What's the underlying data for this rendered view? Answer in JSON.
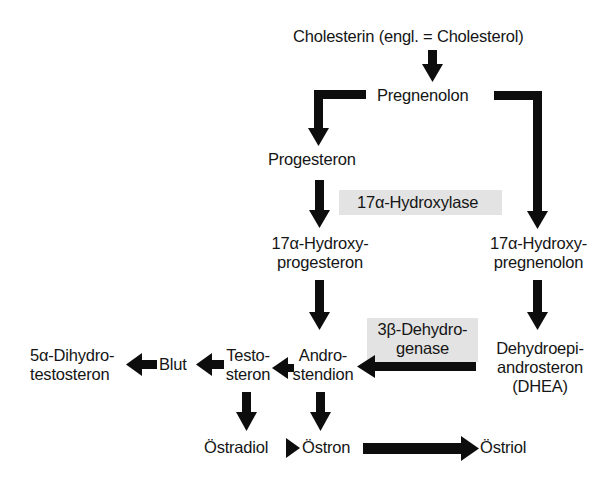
{
  "diagram": {
    "nodes": {
      "cholesterin": "Cholesterin (engl. = Cholesterol)",
      "pregnenolon": "Pregnenolon",
      "progesteron": "Progesteron",
      "hydroxyprogesteron_1": "17α-Hydroxy-",
      "hydroxyprogesteron_2": "progesteron",
      "hydroxypregnenolon_1": "17α-Hydroxy-",
      "hydroxypregnenolon_2": "pregnenolon",
      "dhea_1": "Dehydroepi-",
      "dhea_2": "androsteron",
      "dhea_3": "(DHEA)",
      "androstendion_1": "Andro-",
      "androstendion_2": "stendion",
      "testosteron_1": "Testo-",
      "testosteron_2": "steron",
      "blut": "Blut",
      "dht_1": "5α-Dihydro-",
      "dht_2": "testosteron",
      "oestradiol": "Östradiol",
      "oestron": "Östron",
      "oestriol": "Östriol"
    },
    "enzymes": {
      "hydroxylase": "17α-Hydroxylase",
      "dehydrogenase_1": "3β-Dehydro-",
      "dehydrogenase_2": "genase"
    },
    "edges": [
      {
        "from": "Cholesterin",
        "to": "Pregnenolon"
      },
      {
        "from": "Pregnenolon",
        "to": "Progesteron"
      },
      {
        "from": "Pregnenolon",
        "to": "17α-Hydroxypregnenolon"
      },
      {
        "from": "Progesteron",
        "to": "17α-Hydroxyprogesteron"
      },
      {
        "from": "17α-Hydroxyprogesteron",
        "to": "Androstendion"
      },
      {
        "from": "17α-Hydroxypregnenolon",
        "to": "DHEA"
      },
      {
        "from": "DHEA",
        "to": "Androstendion",
        "enzyme": "3β-Dehydrogenase"
      },
      {
        "from": "Androstendion",
        "to": "Testosteron"
      },
      {
        "from": "Testosteron",
        "to": "Blut"
      },
      {
        "from": "Blut",
        "to": "5α-Dihydrotestosteron"
      },
      {
        "from": "Testosteron",
        "to": "Östradiol"
      },
      {
        "from": "Androstendion",
        "to": "Östron"
      },
      {
        "from": "Östradiol",
        "to": "Östron"
      },
      {
        "from": "Östron",
        "to": "Östriol"
      }
    ],
    "colors": {
      "arrow": "#0d0d0d",
      "enzyme_box": "#e3e3e3",
      "text": "#151515"
    }
  }
}
